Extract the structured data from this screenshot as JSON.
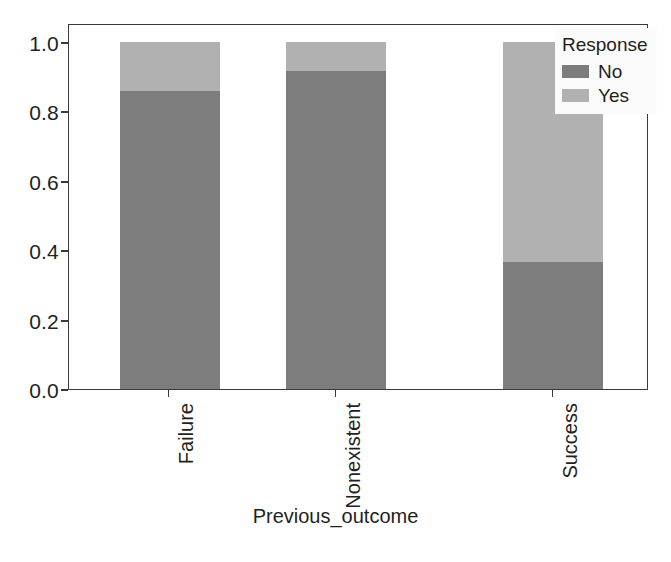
{
  "chart_data": {
    "type": "bar",
    "subtype": "stacked-bar-100-percent",
    "title": "",
    "xlabel": "Previous_outcome",
    "ylabel": "",
    "categories": [
      "Failure",
      "Nonexistent",
      "Success"
    ],
    "series": [
      {
        "name": "No",
        "values": [
          0.86,
          0.915,
          0.365
        ],
        "color": "#7d7d7d"
      },
      {
        "name": "Yes",
        "values": [
          0.14,
          0.085,
          0.635
        ],
        "color": "#b1b1b1"
      }
    ],
    "ylim": [
      0.0,
      1.0
    ],
    "yticks": [
      "0.0",
      "0.2",
      "0.4",
      "0.6",
      "0.8",
      "1.0"
    ],
    "ytick_values": [
      0.0,
      0.2,
      0.4,
      0.6,
      0.8,
      1.0
    ],
    "grid": false,
    "legend": {
      "title": "Response",
      "position": "upper-right",
      "entries": [
        "No",
        "Yes"
      ]
    },
    "xtick_rotation": 90
  },
  "axes": {
    "y_ticks": [
      {
        "label": "1.0",
        "value": 1.0
      },
      {
        "label": "0.8",
        "value": 0.8
      },
      {
        "label": "0.6",
        "value": 0.6
      },
      {
        "label": "0.4",
        "value": 0.4
      },
      {
        "label": "0.2",
        "value": 0.2
      },
      {
        "label": "0.0",
        "value": 0.0
      }
    ],
    "x_title": "Previous_outcome",
    "x_ticks": [
      {
        "label": "Failure"
      },
      {
        "label": "Nonexistent"
      },
      {
        "label": "Success"
      }
    ]
  },
  "legend": {
    "title": "Response",
    "items": [
      {
        "label": "No",
        "color": "#7d7d7d"
      },
      {
        "label": "Yes",
        "color": "#b1b1b1"
      }
    ]
  },
  "bars": [
    {
      "category": "Failure",
      "no": 0.86,
      "yes": 0.14
    },
    {
      "category": "Nonexistent",
      "no": 0.915,
      "yes": 0.085
    },
    {
      "category": "Success",
      "no": 0.365,
      "yes": 0.635
    }
  ]
}
